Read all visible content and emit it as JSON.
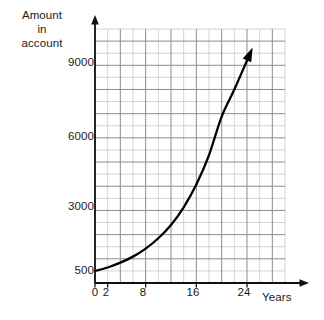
{
  "chart_data": {
    "type": "line",
    "title": "",
    "subtitle": "",
    "ylabel_lines": [
      "Amount",
      "in",
      "account"
    ],
    "ylabel": "Amount in account",
    "xlabel": "Years",
    "xticks": [
      0,
      2,
      8,
      16,
      24
    ],
    "xtick_labels": [
      "0",
      "2",
      "8",
      "16",
      "24"
    ],
    "yticks": [
      500,
      3000,
      6000,
      9000
    ],
    "ytick_labels": [
      "500",
      "3000",
      "6000",
      "9000"
    ],
    "xlim": [
      0,
      30
    ],
    "ylim": [
      0,
      10500
    ],
    "grid": true,
    "grid_major_x_step": 4,
    "grid_minor_x_step": 2,
    "grid_major_y_step": 1000,
    "grid_minor_y_step": 500,
    "legend": null,
    "legend_position": "none",
    "series": [
      {
        "name": "Account balance",
        "arrow_end": true,
        "x": [
          0,
          2,
          4,
          6,
          8,
          10,
          12,
          14,
          16,
          18,
          20,
          22,
          24
        ],
        "y": [
          500,
          640,
          840,
          1090,
          1420,
          1850,
          2400,
          3130,
          4070,
          5290,
          6880,
          8000,
          9200
        ]
      }
    ],
    "annotations": [],
    "colors": {
      "curve": "#000000",
      "grid_major": "#8c8c96",
      "grid_minor": "#c6c6ce",
      "axis": "#111111",
      "text": "#1a1a1a",
      "background": "#ffffff"
    }
  },
  "axes": {
    "y_axis_label_top": "Amount",
    "y_axis_label_mid": "in",
    "y_axis_label_bottom": "account",
    "x_axis_label": "Years"
  }
}
